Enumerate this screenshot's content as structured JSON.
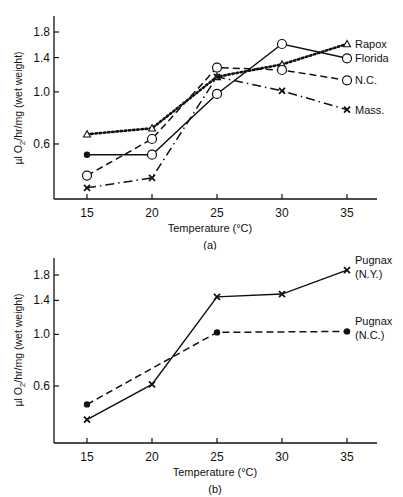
{
  "chart_data": [
    {
      "type": "line",
      "panel_label": "(a)",
      "title": "",
      "xlabel": "Temperature (°C)",
      "ylabel": "µl O2/hr/mg (wet weight)",
      "yscale": "log",
      "x": [
        15,
        20,
        25,
        30,
        35
      ],
      "xticks": [
        "15",
        "20",
        "25",
        "30",
        "35"
      ],
      "yticks": [
        "0.6",
        "1.0",
        "1.4",
        "1.8"
      ],
      "ylim": [
        0.37,
        2.0
      ],
      "grid": false,
      "legend_position": "inline-right",
      "series": [
        {
          "name": "Rapox",
          "marker": "triangle-open",
          "line": "dotted",
          "values": [
            0.66,
            0.7,
            1.16,
            1.31,
            1.6
          ]
        },
        {
          "name": "Florida",
          "marker": "circle-open",
          "line": "solid",
          "values": [
            0.54,
            0.54,
            0.98,
            1.6,
            1.39
          ]
        },
        {
          "name": "N.C.",
          "marker": "circle-open",
          "line": "dashed",
          "values": [
            0.44,
            0.63,
            1.27,
            1.24,
            1.12
          ]
        },
        {
          "name": "Mass.",
          "marker": "x",
          "line": "dash-dot",
          "values": [
            0.39,
            0.43,
            1.16,
            1.01,
            0.84
          ]
        }
      ],
      "first_marker_overrides": {
        "Florida": "circle-filled"
      }
    },
    {
      "type": "line",
      "panel_label": "(b)",
      "title": "",
      "xlabel": "Temperature (°C)",
      "ylabel": "µl O2/hr/mg (wet weight)",
      "yscale": "log",
      "x": [
        15,
        20,
        25,
        30,
        35
      ],
      "xticks": [
        "15",
        "20",
        "25",
        "30",
        "35"
      ],
      "yticks": [
        "0.6",
        "1.0",
        "1.4",
        "1.8"
      ],
      "ylim": [
        0.37,
        2.0
      ],
      "grid": false,
      "legend_position": "inline-right",
      "series": [
        {
          "name": "Pugnax (N.Y.)",
          "label_lines": [
            "Pugnax",
            "(N.Y.)"
          ],
          "marker": "x",
          "line": "solid",
          "x": [
            15,
            20,
            25,
            30,
            35
          ],
          "values": [
            0.43,
            0.61,
            1.45,
            1.49,
            1.89
          ]
        },
        {
          "name": "Pugnax (N.C.)",
          "label_lines": [
            "Pugnax",
            "(N.C.)"
          ],
          "marker": "circle-filled",
          "line": "dashed",
          "x": [
            15,
            25,
            35
          ],
          "values": [
            0.5,
            1.02,
            1.03
          ]
        }
      ]
    }
  ],
  "labels": {
    "a": {
      "xlabel": "Temperature (°C)",
      "panel": "(a)",
      "ylabel_pre": "µl O",
      "ylabel_sub": "2",
      "ylabel_post": "/hr/mg (wet weight)"
    },
    "b": {
      "xlabel": "Temperature (°C)",
      "panel": "(b)",
      "ylabel_pre": "µl O",
      "ylabel_sub": "2",
      "ylabel_post": "/hr/mg (wet weight)"
    }
  }
}
